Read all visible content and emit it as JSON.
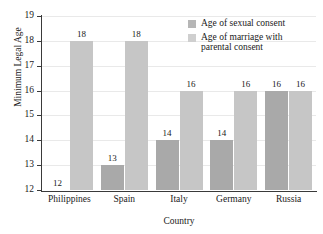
{
  "chart_data": {
    "type": "bar",
    "title": "Minimum Legal Ages of Sexual Consent and Marriage",
    "xlabel": "Country",
    "ylabel": "Minimum Legal Age",
    "categories": [
      "Philippines",
      "Spain",
      "Italy",
      "Germany",
      "Russia"
    ],
    "series": [
      {
        "name": "Age of sexual consent",
        "values": [
          12,
          13,
          14,
          14,
          16
        ],
        "color": "#a9a9a9"
      },
      {
        "name": "Age of marriage with parental consent",
        "values": [
          18,
          18,
          16,
          16,
          16
        ],
        "color": "#c6c6c6"
      }
    ],
    "ylim": [
      12,
      19
    ],
    "yticks": [
      12,
      13,
      14,
      15,
      16,
      17,
      18,
      19
    ],
    "ytick_labels": [
      "12",
      "13",
      "14",
      "15",
      "16",
      "17",
      "18",
      "19"
    ],
    "grid": "horizontal",
    "legend_position": "top-right-inside",
    "bar_labels_shown": true
  },
  "legend": {
    "entries": [
      {
        "label": "Age of sexual consent",
        "swatch": "#b6b6b6"
      },
      {
        "label": "Age of marriage with parental consent",
        "swatch": "#cfcfcf"
      }
    ],
    "entry_0_line_0": "Age of sexual consent",
    "entry_1_line_0": "Age of marriage with",
    "entry_1_line_1": "parental consent"
  },
  "axes": {
    "ylabel": "Minimum Legal Age",
    "xlabel": "Country",
    "ytick_12": "12",
    "ytick_13": "13",
    "ytick_14": "14",
    "ytick_15": "15",
    "ytick_16": "16",
    "ytick_17": "17",
    "ytick_18": "18",
    "ytick_19": "19"
  },
  "bar_value_labels": {
    "philippines_consent": "12",
    "philippines_marriage": "18",
    "spain_consent": "13",
    "spain_marriage": "18",
    "italy_consent": "14",
    "italy_marriage": "16",
    "germany_consent": "14",
    "germany_marriage": "16",
    "russia_consent": "16",
    "russia_marriage": "16"
  },
  "category_labels": {
    "c0": "Philippines",
    "c1": "Spain",
    "c2": "Italy",
    "c3": "Germany",
    "c4": "Russia"
  }
}
